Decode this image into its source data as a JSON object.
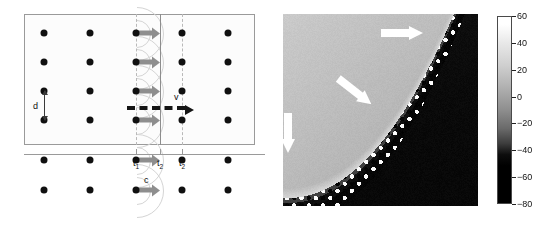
{
  "figure": {
    "type": "two-panel scientific figure",
    "panels": [
      "huygens-construction-schematic",
      "field-heatmap"
    ]
  },
  "left_panel": {
    "name": "huygens-wavefront-schematic",
    "box": {
      "x": 24,
      "y": 14,
      "width": 231,
      "height": 131
    },
    "lattice": {
      "columns_x": [
        44,
        90,
        136,
        182,
        228
      ],
      "rows_y": [
        33,
        62,
        91,
        120,
        160,
        190
      ],
      "dot_radius": 3.5,
      "dot_color": "#101010"
    },
    "labels": {
      "spacing": "d",
      "source_speed": "c",
      "front_velocity": "v"
    },
    "axis_ticks": [
      {
        "label": "t",
        "sub": "1",
        "x": 136
      },
      {
        "label": "t",
        "sub": "2",
        "x": 160
      },
      {
        "label": "t",
        "sub": "2",
        "x": 182
      }
    ],
    "lines": {
      "t1_dashed_x": 136,
      "t2_solid_x": 160,
      "t2_dashed_x": 182
    },
    "gray_arrow_color": "#8e8e8e",
    "wavelet_color": "#d4d4d4"
  },
  "right_panel": {
    "name": "field-heatmap",
    "box": {
      "x": 283,
      "y": 14,
      "width": 195,
      "height": 192
    },
    "arrows": [
      {
        "name": "arrow-top-right",
        "direction": "right"
      },
      {
        "name": "arrow-middle",
        "direction": "down-right"
      },
      {
        "name": "arrow-left",
        "direction": "down"
      }
    ],
    "arrow_color": "#ffffff"
  },
  "colorbar": {
    "name": "intensity-colorbar",
    "orientation": "vertical",
    "min": -80,
    "max": 60,
    "ticks": [
      60,
      40,
      20,
      0,
      -20,
      -40,
      -60,
      -80
    ],
    "tick_labels": [
      "60",
      "40",
      "20",
      "0",
      "−20",
      "−40",
      "−60",
      "−80"
    ],
    "gradient": "white-to-black"
  },
  "chart_data": {
    "type": "heatmap",
    "title": "",
    "xlabel": "",
    "ylabel": "",
    "colorbar_label": "",
    "zlim": [
      -80,
      60
    ],
    "colormap": "gray",
    "annotations": [
      {
        "text": "",
        "marker": "white-arrow",
        "x_frac": 0.62,
        "y_frac": 0.12,
        "direction": "right"
      },
      {
        "text": "",
        "marker": "white-arrow",
        "x_frac": 0.36,
        "y_frac": 0.38,
        "direction": "down-right"
      },
      {
        "text": "",
        "marker": "white-arrow",
        "x_frac": 0.06,
        "y_frac": 0.6,
        "direction": "down"
      }
    ],
    "legend_position": "right",
    "grid": false
  }
}
